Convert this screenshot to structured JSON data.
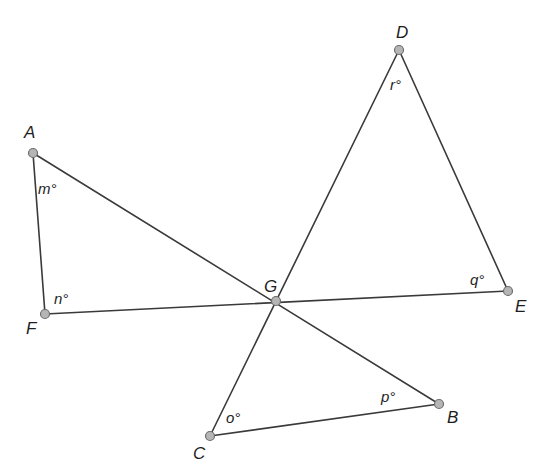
{
  "diagram": {
    "type": "geometry-figure",
    "points": [
      {
        "id": "A",
        "label": "A",
        "x": 33,
        "y": 153,
        "label_x": 24,
        "label_y": 138
      },
      {
        "id": "F",
        "label": "F",
        "x": 45,
        "y": 314,
        "label_x": 26,
        "label_y": 334
      },
      {
        "id": "D",
        "label": "D",
        "x": 399,
        "y": 50,
        "label_x": 396,
        "label_y": 38
      },
      {
        "id": "E",
        "label": "E",
        "x": 508,
        "y": 291,
        "label_x": 515,
        "label_y": 312
      },
      {
        "id": "G",
        "label": "G",
        "x": 276,
        "y": 301,
        "label_x": 264,
        "label_y": 292
      },
      {
        "id": "C",
        "label": "C",
        "x": 210,
        "y": 436,
        "label_x": 193,
        "label_y": 459
      },
      {
        "id": "B",
        "label": "B",
        "x": 439,
        "y": 404,
        "label_x": 447,
        "label_y": 423
      }
    ],
    "segments": [
      {
        "from": "A",
        "to": "F"
      },
      {
        "from": "A",
        "to": "B"
      },
      {
        "from": "F",
        "to": "E"
      },
      {
        "from": "D",
        "to": "E"
      },
      {
        "from": "D",
        "to": "C"
      },
      {
        "from": "C",
        "to": "B"
      }
    ],
    "angles": [
      {
        "id": "m",
        "label": "m°",
        "vertex": "A",
        "x": 38,
        "y": 194
      },
      {
        "id": "n",
        "label": "n°",
        "vertex": "F",
        "x": 54,
        "y": 304
      },
      {
        "id": "r",
        "label": "r°",
        "vertex": "D",
        "x": 390,
        "y": 90
      },
      {
        "id": "q",
        "label": "q°",
        "vertex": "E",
        "x": 470,
        "y": 285
      },
      {
        "id": "o",
        "label": "o°",
        "vertex": "C",
        "x": 226,
        "y": 423
      },
      {
        "id": "p",
        "label": "p°",
        "vertex": "B",
        "x": 381,
        "y": 402
      }
    ]
  }
}
